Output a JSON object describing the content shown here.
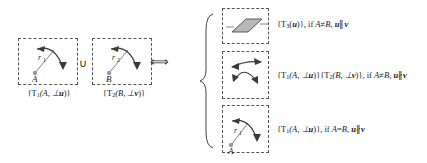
{
  "figure": {
    "kind": "math-diagram",
    "operator_union": "∪",
    "operator_iff": "⟺"
  },
  "left": {
    "box_a": {
      "radius_label": "r",
      "radius_sub": "1",
      "point_label": "A",
      "caption_prefix": "{T",
      "caption_sub": "1",
      "caption_body": "(A, ⊥",
      "caption_vector": "u",
      "caption_suffix": ")}"
    },
    "box_b": {
      "radius_label": "r",
      "radius_sub": "2",
      "point_label": "B",
      "caption_prefix": "{T",
      "caption_sub": "2",
      "caption_body": "(B, ⊥",
      "caption_vector": "v",
      "caption_suffix": ")}"
    },
    "caption_a": "{T1(A, ⊥u)}",
    "caption_b": "{T2(B, ⊥v)}"
  },
  "right": {
    "case_1": {
      "icon": "parallelogram-plane",
      "result_prefix": "{T",
      "result_sub": "3",
      "result_mid": "(",
      "result_vector": "u",
      "result_suffix": ")}, if ",
      "cond_a": "A",
      "cond_neq": "≠",
      "cond_b": "B",
      "cond_comma": ", ",
      "cond_u": "u",
      "cond_rel": "∥",
      "cond_v": "v",
      "text": "{T3(u)}, if A≠B, u∥v"
    },
    "case_2": {
      "icon": "crossed-arrows",
      "t1_prefix": "{T",
      "t1_sub": "1",
      "t1_body": "(A, ⊥",
      "t1_vector": "u",
      "t1_suffix": ")}",
      "t2_prefix": "{T",
      "t2_sub": "2",
      "t2_body": "(B, ⊥",
      "t2_vector": "v",
      "t2_suffix": ")}, if ",
      "cond_a": "A",
      "cond_neq": "≠",
      "cond_b": "B",
      "cond_comma": ",  ",
      "cond_u": "u",
      "cond_rel": "∦",
      "cond_v": "v",
      "text": "{T1(A, ⊥u)}{T2(B, ⊥v)}, if A≠B, u∦v"
    },
    "case_3": {
      "icon": "single-rotation-arrow",
      "radius_label": "r",
      "radius_sub": "1",
      "point_label": "A",
      "result_prefix": "{T",
      "result_sub": "1",
      "result_body": "(A, ⊥",
      "result_vector": "u",
      "result_suffix": ")}, if ",
      "cond_a": "A",
      "cond_eq": "=",
      "cond_b": "B",
      "cond_comma": ",  ",
      "cond_u": "u",
      "cond_rel": "∦",
      "cond_v": "v",
      "text": "{T1(A, ⊥u)}, if A=B, u∦v"
    }
  }
}
